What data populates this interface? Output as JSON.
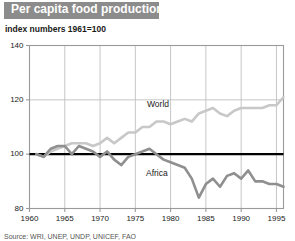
{
  "title": "Per capita food production",
  "subtitle": "index numbers  1961=100",
  "source_note": "Source: WRI, UNEP, UNDP, UNICEF, FAO",
  "colors": {
    "banner": "#8c8c8c",
    "title_text": "#ffffff",
    "world_line": "#c8c8c8",
    "africa_line": "#8f8f8f",
    "baseline": "#000000",
    "grid": "#c0c0c0",
    "frame": "#9a9a9a",
    "text": "#1a1a1a"
  },
  "chart_data": {
    "type": "line",
    "title": "Per capita food production",
    "subtitle": "index numbers  1961=100",
    "xlabel": "",
    "ylabel": "index numbers 1961=100",
    "xlim": [
      1960,
      1996
    ],
    "ylim": [
      80,
      140
    ],
    "yticks": [
      80,
      100,
      120,
      140
    ],
    "xticks": [
      1960,
      1965,
      1970,
      1975,
      1980,
      1985,
      1990,
      1995
    ],
    "grid": true,
    "legend": "inline-labels",
    "reference_line": {
      "value": 100,
      "label": "1961=100",
      "style": "bold-black"
    },
    "x": [
      1961,
      1962,
      1963,
      1964,
      1965,
      1966,
      1967,
      1968,
      1969,
      1970,
      1971,
      1972,
      1973,
      1974,
      1975,
      1976,
      1977,
      1978,
      1979,
      1980,
      1981,
      1982,
      1983,
      1984,
      1985,
      1986,
      1987,
      1988,
      1989,
      1990,
      1991,
      1992,
      1993,
      1994,
      1995,
      1996
    ],
    "series": [
      {
        "name": "World",
        "color": "#c8c8c8",
        "values": [
          100,
          99,
          101,
          102,
          103,
          104,
          104,
          104,
          103,
          104,
          106,
          104,
          106,
          108,
          108,
          110,
          110,
          112,
          112,
          111,
          112,
          113,
          112,
          115,
          116,
          117,
          115,
          114,
          116,
          117,
          117,
          117,
          117,
          118,
          118,
          121
        ]
      },
      {
        "name": "Africa",
        "color": "#8f8f8f",
        "values": [
          100,
          99,
          102,
          103,
          103,
          100,
          103,
          102,
          101,
          99,
          101,
          98,
          96,
          99,
          100,
          101,
          102,
          100,
          98,
          97,
          96,
          95,
          91,
          84,
          89,
          91,
          88,
          92,
          93,
          91,
          94,
          90,
          90,
          89,
          89,
          88
        ]
      }
    ]
  }
}
